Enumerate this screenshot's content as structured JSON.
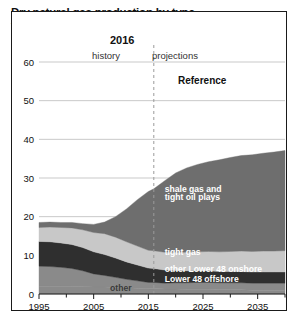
{
  "chart": {
    "title": "Dry natural gas production by type",
    "subtitle": "trillion cubic feet",
    "divider_year_label": "2016",
    "history_label": "history",
    "projections_label": "projections",
    "case_label": "Reference"
  },
  "chart_data": {
    "type": "area",
    "title": "Dry natural gas production by type",
    "subtitle": "trillion cubic feet",
    "xlabel": "",
    "ylabel": "trillion cubic feet",
    "xlim": [
      1995,
      2040
    ],
    "ylim": [
      0,
      60
    ],
    "ytick_labels": [
      "0",
      "10",
      "20",
      "30",
      "40",
      "50",
      "60"
    ],
    "yticks": [
      0,
      10,
      20,
      30,
      40,
      50,
      60
    ],
    "xtick_labels": [
      "1995",
      "2005",
      "2015",
      "2025",
      "2035"
    ],
    "xticks": [
      1995,
      2005,
      2015,
      2025,
      2035
    ],
    "xminor_step": 5,
    "grid": "horizontal",
    "legend": "inline-annotations",
    "divider_year": 2016,
    "divider_style": "dashed",
    "x": [
      1995,
      1997,
      1999,
      2001,
      2003,
      2005,
      2007,
      2009,
      2011,
      2013,
      2015,
      2016,
      2018,
      2020,
      2022,
      2024,
      2026,
      2028,
      2030,
      2032,
      2034,
      2036,
      2038,
      2040
    ],
    "stack_order_bottom_to_top": [
      "other",
      "Lower 48 offshore",
      "other Lower 48 onshore",
      "tight gas",
      "shale gas and tight oil plays"
    ],
    "series": [
      {
        "name": "other",
        "color": "#8a8a8a",
        "label": "other",
        "values": [
          2.0,
          2.0,
          2.0,
          2.0,
          1.9,
          1.8,
          1.8,
          1.7,
          1.6,
          1.5,
          1.4,
          1.4,
          1.3,
          1.3,
          1.2,
          1.2,
          1.2,
          1.1,
          1.1,
          1.1,
          1.0,
          1.0,
          1.0,
          1.0
        ]
      },
      {
        "name": "Lower 48 offshore",
        "color": "#8a8a8a",
        "label": "Lower 48 offshore",
        "values": [
          5.2,
          5.1,
          4.9,
          4.6,
          4.1,
          3.4,
          3.0,
          2.6,
          2.2,
          1.9,
          1.6,
          1.6,
          1.5,
          1.6,
          1.7,
          1.8,
          1.8,
          1.8,
          1.8,
          1.8,
          1.8,
          1.8,
          1.8,
          1.8
        ]
      },
      {
        "name": "other Lower 48 onshore",
        "color": "#2f2f2f",
        "label": "other Lower 48 onshore",
        "values": [
          6.4,
          6.4,
          6.3,
          6.2,
          6.0,
          5.7,
          5.4,
          5.0,
          4.5,
          4.1,
          3.7,
          3.6,
          3.4,
          3.2,
          3.1,
          3.0,
          3.0,
          2.9,
          2.9,
          2.9,
          2.9,
          2.9,
          2.9,
          2.9
        ]
      },
      {
        "name": "tight gas",
        "color": "#c8c8c8",
        "label": "tight gas",
        "values": [
          3.6,
          3.8,
          4.0,
          4.3,
          4.6,
          5.0,
          5.4,
          5.4,
          5.2,
          4.9,
          4.6,
          4.6,
          4.6,
          4.7,
          4.8,
          4.9,
          5.0,
          5.1,
          5.2,
          5.3,
          5.3,
          5.4,
          5.4,
          5.5
        ]
      },
      {
        "name": "shale gas and tight oil plays",
        "color": "#6e6e6e",
        "label": "shale gas and tight oil plays",
        "values": [
          1.3,
          1.3,
          1.3,
          1.4,
          1.6,
          2.1,
          3.0,
          5.3,
          8.5,
          12.0,
          15.2,
          16.0,
          18.5,
          20.5,
          21.8,
          22.6,
          23.2,
          23.8,
          24.3,
          24.7,
          25.0,
          25.3,
          25.6,
          25.9
        ]
      }
    ],
    "totals": [
      18.5,
      18.6,
      18.5,
      18.5,
      18.2,
      18.0,
      18.6,
      20.0,
      22.0,
      24.4,
      26.5,
      27.2,
      29.3,
      31.3,
      32.6,
      33.5,
      34.2,
      34.7,
      35.3,
      35.8,
      36.0,
      36.4,
      36.7,
      37.1
    ],
    "annotations": [
      {
        "text": "shale gas and",
        "x": 2018,
        "y": 26.5,
        "color": "#ffffff"
      },
      {
        "text": "tight oil plays",
        "x": 2018,
        "y": 24.3,
        "color": "#ffffff"
      },
      {
        "text": "tight gas",
        "x": 2018,
        "y": 10.2,
        "color": "#ffffff"
      },
      {
        "text": "other Lower 48 onshore",
        "x": 2018,
        "y": 5.6,
        "color": "#ffffff"
      },
      {
        "text": "Lower 48 offshore",
        "x": 2018,
        "y": 3.0,
        "color": "#ffffff"
      },
      {
        "text": "other",
        "x": 2008,
        "y": 0.9,
        "color": "#3a3a3a"
      }
    ]
  }
}
